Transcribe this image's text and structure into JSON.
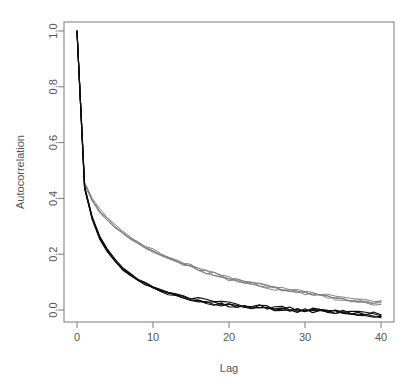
{
  "chart_data": {
    "type": "line",
    "title": "",
    "xlabel": "Lag",
    "ylabel": "Autocorrelation",
    "xlim": [
      0,
      40
    ],
    "ylim": [
      -0.04,
      1.0
    ],
    "grid": false,
    "legend": null,
    "xticks": [
      0,
      10,
      20,
      30,
      40
    ],
    "xtick_labels": [
      "0",
      "10",
      "20",
      "30",
      "40"
    ],
    "yticks": [
      0.0,
      0.2,
      0.4,
      0.6,
      0.8,
      1.0
    ],
    "ytick_labels": [
      "0.0",
      "0.2",
      "0.4",
      "0.6",
      "0.8",
      "1.0"
    ],
    "x": [
      0,
      1,
      2,
      3,
      4,
      5,
      6,
      7,
      8,
      9,
      10,
      11,
      12,
      13,
      14,
      15,
      16,
      17,
      18,
      19,
      20,
      21,
      22,
      23,
      24,
      25,
      26,
      27,
      28,
      29,
      30,
      31,
      32,
      33,
      34,
      35,
      36,
      37,
      38,
      39,
      40
    ],
    "series": [
      {
        "name": "chain-A-slow",
        "color": "#787878",
        "group": "upper",
        "values": [
          1.0,
          0.455,
          0.395,
          0.355,
          0.325,
          0.3,
          0.278,
          0.259,
          0.242,
          0.227,
          0.212,
          0.199,
          0.187,
          0.176,
          0.165,
          0.155,
          0.146,
          0.137,
          0.129,
          0.121,
          0.114,
          0.107,
          0.101,
          0.095,
          0.089,
          0.084,
          0.079,
          0.074,
          0.069,
          0.065,
          0.061,
          0.057,
          0.053,
          0.049,
          0.045,
          0.041,
          0.037,
          0.033,
          0.029,
          0.025,
          0.021
        ]
      },
      {
        "name": "chain-B-slow",
        "color": "#787878",
        "group": "upper",
        "values": [
          1.0,
          0.45,
          0.392,
          0.35,
          0.32,
          0.296,
          0.274,
          0.255,
          0.238,
          0.223,
          0.209,
          0.196,
          0.184,
          0.172,
          0.162,
          0.152,
          0.143,
          0.134,
          0.126,
          0.119,
          0.112,
          0.105,
          0.099,
          0.093,
          0.087,
          0.082,
          0.077,
          0.072,
          0.068,
          0.064,
          0.06,
          0.056,
          0.052,
          0.048,
          0.044,
          0.04,
          0.036,
          0.033,
          0.03,
          0.027,
          0.024
        ]
      },
      {
        "name": "chain-C-slow",
        "color": "#8a8a8a",
        "group": "upper",
        "values": [
          1.0,
          0.458,
          0.4,
          0.36,
          0.33,
          0.305,
          0.283,
          0.263,
          0.246,
          0.23,
          0.216,
          0.203,
          0.19,
          0.179,
          0.168,
          0.158,
          0.148,
          0.139,
          0.131,
          0.123,
          0.116,
          0.109,
          0.102,
          0.096,
          0.09,
          0.085,
          0.08,
          0.075,
          0.07,
          0.066,
          0.062,
          0.058,
          0.054,
          0.05,
          0.046,
          0.042,
          0.038,
          0.034,
          0.031,
          0.028,
          0.025
        ]
      },
      {
        "name": "chain-D-slow",
        "color": "#909090",
        "group": "upper",
        "values": [
          1.0,
          0.452,
          0.393,
          0.352,
          0.322,
          0.298,
          0.276,
          0.257,
          0.24,
          0.225,
          0.211,
          0.197,
          0.185,
          0.174,
          0.163,
          0.153,
          0.144,
          0.136,
          0.128,
          0.12,
          0.113,
          0.106,
          0.1,
          0.094,
          0.088,
          0.083,
          0.078,
          0.073,
          0.069,
          0.065,
          0.061,
          0.057,
          0.053,
          0.049,
          0.046,
          0.042,
          0.039,
          0.036,
          0.033,
          0.03,
          0.027
        ]
      },
      {
        "name": "chain-E-fast",
        "color": "#0d0d0d",
        "group": "lower",
        "values": [
          1.0,
          0.44,
          0.33,
          0.262,
          0.214,
          0.178,
          0.15,
          0.128,
          0.11,
          0.095,
          0.082,
          0.071,
          0.062,
          0.054,
          0.047,
          0.041,
          0.036,
          0.031,
          0.027,
          0.024,
          0.02,
          0.017,
          0.015,
          0.012,
          0.01,
          0.008,
          0.006,
          0.004,
          0.003,
          0.001,
          0.0,
          -0.002,
          -0.003,
          -0.005,
          -0.007,
          -0.009,
          -0.011,
          -0.013,
          -0.016,
          -0.019,
          -0.022
        ]
      },
      {
        "name": "chain-F-fast",
        "color": "#1a1a1a",
        "group": "lower",
        "values": [
          1.0,
          0.437,
          0.327,
          0.258,
          0.21,
          0.175,
          0.147,
          0.125,
          0.107,
          0.092,
          0.08,
          0.069,
          0.06,
          0.052,
          0.045,
          0.039,
          0.034,
          0.03,
          0.026,
          0.022,
          0.019,
          0.016,
          0.013,
          0.011,
          0.009,
          0.007,
          0.005,
          0.003,
          0.002,
          0.0,
          -0.001,
          -0.003,
          -0.004,
          -0.006,
          -0.007,
          -0.009,
          -0.01,
          -0.012,
          -0.014,
          -0.016,
          -0.018
        ]
      },
      {
        "name": "chain-G-fast",
        "color": "#141414",
        "group": "lower",
        "values": [
          1.0,
          0.443,
          0.334,
          0.265,
          0.217,
          0.181,
          0.153,
          0.131,
          0.113,
          0.098,
          0.085,
          0.074,
          0.064,
          0.056,
          0.049,
          0.043,
          0.038,
          0.033,
          0.029,
          0.025,
          0.022,
          0.019,
          0.016,
          0.014,
          0.011,
          0.009,
          0.007,
          0.005,
          0.004,
          0.002,
          0.001,
          -0.001,
          -0.002,
          -0.004,
          -0.005,
          -0.007,
          -0.009,
          -0.011,
          -0.013,
          -0.015,
          -0.017
        ]
      },
      {
        "name": "chain-H-fast",
        "color": "#222222",
        "group": "lower",
        "values": [
          1.0,
          0.435,
          0.325,
          0.256,
          0.208,
          0.173,
          0.145,
          0.123,
          0.105,
          0.09,
          0.078,
          0.067,
          0.058,
          0.05,
          0.044,
          0.038,
          0.033,
          0.029,
          0.025,
          0.021,
          0.018,
          0.015,
          0.012,
          0.01,
          0.008,
          0.006,
          0.004,
          0.002,
          0.001,
          -0.001,
          -0.002,
          -0.004,
          -0.006,
          -0.008,
          -0.01,
          -0.012,
          -0.014,
          -0.017,
          -0.02,
          -0.023,
          -0.026
        ]
      }
    ],
    "annotations": []
  },
  "geometry": {
    "plot_left": 64,
    "plot_right": 394,
    "plot_top": 22,
    "plot_bottom": 322
  }
}
